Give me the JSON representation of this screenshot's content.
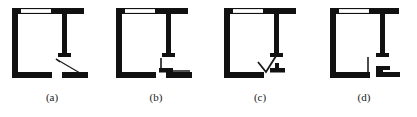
{
  "figure": {
    "kind": "architectural-floor-plan-comparison",
    "panel_count": 4,
    "colors": {
      "wall": "#111111",
      "background": "#ffffff",
      "window": "#ffffff",
      "leaf": "#1a1a1a"
    },
    "panels": [
      {
        "id": "a",
        "caption": "(a)",
        "door_type": "single-swing-door",
        "elements": [
          "left-wall",
          "top-wall-with-window",
          "right-wall-stub",
          "bottom-left-wall",
          "bottom-right-wall",
          "door-leaf-wedge"
        ]
      },
      {
        "id": "b",
        "caption": "(b)",
        "door_type": "sliding-door-right-angle",
        "elements": [
          "left-wall",
          "top-wall-with-window",
          "right-wall-stub",
          "bottom-left-wall",
          "bottom-right-wall",
          "door-leaf-l-shape"
        ]
      },
      {
        "id": "c",
        "caption": "(c)",
        "door_type": "folding-door-v-shape",
        "elements": [
          "left-wall",
          "top-wall-with-window",
          "right-wall-stub",
          "bottom-left-wall",
          "bottom-right-wall",
          "door-leaf-v-shape"
        ]
      },
      {
        "id": "d",
        "caption": "(d)",
        "door_type": "pocket-door-opening",
        "elements": [
          "left-wall",
          "top-wall-with-window",
          "right-wall-stub",
          "bottom-left-wall-thin-return",
          "bottom-right-wall",
          "door-leaf-pocket-block"
        ]
      }
    ]
  }
}
